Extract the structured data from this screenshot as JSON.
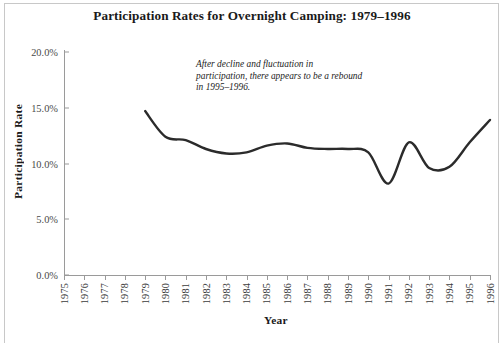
{
  "chart_data": {
    "type": "line",
    "title": "Participation Rates for Overnight Camping: 1979–1996",
    "xlabel": "Year",
    "ylabel": "Participation Rate",
    "xlim": [
      1975,
      1996
    ],
    "ylim": [
      0,
      20
    ],
    "grid": false,
    "legend": null,
    "x_tick_labels": [
      "1975",
      "1976",
      "1977",
      "1978",
      "1979",
      "1980",
      "1981",
      "1982",
      "1983",
      "1984",
      "1985",
      "1986",
      "1987",
      "1988",
      "1989",
      "1990",
      "1991",
      "1992",
      "1993",
      "1994",
      "1995",
      "1996"
    ],
    "y_tick_labels": [
      "0.0%",
      "5.0%",
      "10.0%",
      "15.0%",
      "20.0%"
    ],
    "y_tick_values": [
      0,
      5,
      10,
      15,
      20
    ],
    "series": [
      {
        "name": "Overnight Camping Participation Rate",
        "color": "#2b2b2b",
        "x": [
          1979,
          1980,
          1981,
          1982,
          1983,
          1984,
          1985,
          1986,
          1987,
          1988,
          1989,
          1990,
          1991,
          1992,
          1993,
          1994,
          1995,
          1996
        ],
        "values": [
          14.7,
          12.4,
          12.1,
          11.3,
          10.9,
          11.0,
          11.6,
          11.8,
          11.4,
          11.3,
          11.3,
          11.0,
          8.2,
          11.9,
          9.6,
          9.7,
          11.9,
          13.9
        ]
      }
    ],
    "annotations": [
      {
        "name": "rebound-note",
        "text": "After decline and fluctuation in participation, there appears to be a rebound in 1995–1996.",
        "lines": [
          "After decline and fluctuation in",
          "participation, there appears to be a rebound",
          "in 1995–1996."
        ],
        "style": "italic"
      }
    ]
  },
  "caption": {
    "text": ""
  },
  "colors": {
    "line": "#2b2b2b",
    "axis": "#9a9a9a",
    "text": "#1a1a1a",
    "frame": "#c8c8c8",
    "background": "#ffffff"
  }
}
